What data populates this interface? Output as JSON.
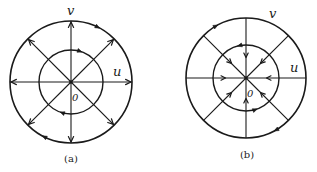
{
  "colors": {
    "ink": "#1a1a1a",
    "background": "#ffffff"
  },
  "diagrams": [
    {
      "id": "a",
      "caption": "(a)",
      "center": [
        71,
        82
      ],
      "outer_radius": 61,
      "inner_radius": 32,
      "radial_lines": 8,
      "radial_arrows": "outward-at-outer-circle",
      "outer_circle_arrows": [
        {
          "angle_deg": -62,
          "direction": "cw"
        },
        {
          "angle_deg": 118,
          "direction": "cw"
        }
      ],
      "inner_circle_arrows": [
        {
          "angle_deg": -70,
          "direction": "cw"
        },
        {
          "angle_deg": 110,
          "direction": "cw"
        }
      ],
      "axis_labels": {
        "u": "u",
        "v": "v",
        "origin": "0"
      },
      "label_positions": {
        "u": [
          113,
          76
        ],
        "v": [
          67,
          15
        ],
        "origin": [
          72,
          101
        ],
        "caption": [
          71,
          162
        ]
      }
    },
    {
      "id": "b",
      "caption": "(b)",
      "center": [
        246,
        78
      ],
      "outer_radius": 60,
      "inner_radius": 33,
      "radial_lines": 8,
      "radial_arrows": "inward-at-mid-inner",
      "outer_circle_arrows": [
        {
          "angle_deg": -118,
          "direction": "cw"
        },
        {
          "angle_deg": 62,
          "direction": "cw"
        }
      ],
      "inner_circle_arrows": [
        {
          "angle_deg": -105,
          "direction": "ccw"
        },
        {
          "angle_deg": 70,
          "direction": "ccw"
        }
      ],
      "axis_labels": {
        "u": "u",
        "v": "v",
        "origin": "0"
      },
      "label_positions": {
        "u": [
          290,
          72
        ],
        "v": [
          269,
          18
        ],
        "origin": [
          247,
          97
        ],
        "caption": [
          247,
          158
        ]
      }
    }
  ]
}
